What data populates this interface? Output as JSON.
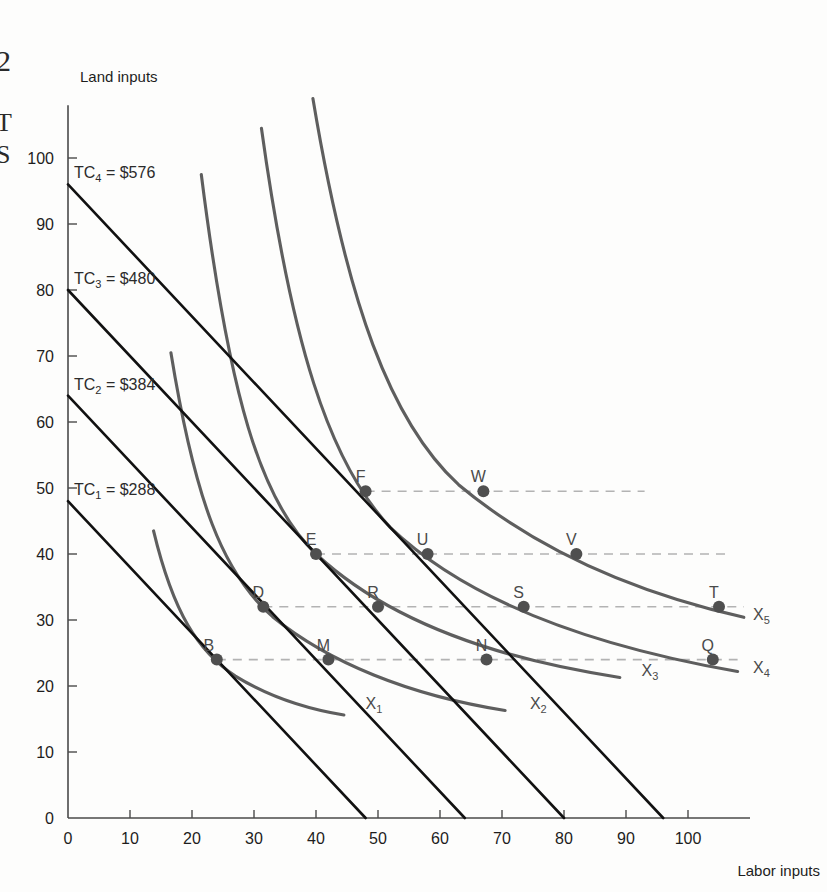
{
  "margin": {
    "figure_number": "2",
    "line2": "T",
    "line3": "S"
  },
  "axes": {
    "y_title": "Land inputs",
    "x_title": "Labor inputs",
    "x_ticks": [
      "0",
      "10",
      "20",
      "30",
      "40",
      "50",
      "60",
      "70",
      "80",
      "90",
      "100"
    ],
    "y_ticks": [
      "0",
      "10",
      "20",
      "30",
      "40",
      "50",
      "60",
      "70",
      "80",
      "90",
      "100"
    ],
    "x_range": [
      0,
      110
    ],
    "y_range": [
      0,
      108
    ]
  },
  "isocosts": [
    {
      "key": "TC1",
      "label": "TC",
      "sub": "1",
      "value": "= $288",
      "y_intercept": 48,
      "x_intercept": 48
    },
    {
      "key": "TC2",
      "label": "TC",
      "sub": "2",
      "value": "= $384",
      "y_intercept": 64,
      "x_intercept": 64
    },
    {
      "key": "TC3",
      "label": "TC",
      "sub": "3",
      "value": "= $480",
      "y_intercept": 80,
      "x_intercept": 80
    },
    {
      "key": "TC4",
      "label": "TC",
      "sub": "4",
      "value": "= $576",
      "y_intercept": 96,
      "x_intercept": 96
    }
  ],
  "isoquants": [
    {
      "key": "X1",
      "label": "X",
      "sub": "1",
      "label_x": 48,
      "label_y": 16.5
    },
    {
      "key": "X2",
      "label": "X",
      "sub": "2",
      "label_x": 74.5,
      "label_y": 16.5
    },
    {
      "key": "X3",
      "label": "X",
      "sub": "3",
      "label_x": 92.5,
      "label_y": 21.5
    },
    {
      "key": "X4",
      "label": "X",
      "sub": "4",
      "label_x": 110.5,
      "label_y": 22.0
    },
    {
      "key": "X5",
      "label": "X",
      "sub": "5",
      "label_x": 110.5,
      "label_y": 30.0
    }
  ],
  "points": [
    {
      "label": "B",
      "x": 24,
      "y": 24,
      "lx": -8,
      "ly": 9
    },
    {
      "label": "M",
      "x": 42,
      "y": 24,
      "lx": -5,
      "ly": 9
    },
    {
      "label": "N",
      "x": 67.5,
      "y": 24,
      "lx": -5,
      "ly": 9
    },
    {
      "label": "Q",
      "x": 104,
      "y": 24,
      "lx": -5,
      "ly": 9
    },
    {
      "label": "D",
      "x": 31.5,
      "y": 32,
      "lx": -5,
      "ly": 9
    },
    {
      "label": "R",
      "x": 50,
      "y": 32,
      "lx": -5,
      "ly": 9
    },
    {
      "label": "S",
      "x": 73.5,
      "y": 32,
      "lx": -5,
      "ly": 9
    },
    {
      "label": "T",
      "x": 105,
      "y": 32,
      "lx": -5,
      "ly": 9
    },
    {
      "label": "E",
      "x": 40,
      "y": 40,
      "lx": -5,
      "ly": 9
    },
    {
      "label": "U",
      "x": 58,
      "y": 40,
      "lx": -5,
      "ly": 9
    },
    {
      "label": "V",
      "x": 82,
      "y": 40,
      "lx": -5,
      "ly": 9
    },
    {
      "label": "F",
      "x": 48,
      "y": 49.5,
      "lx": -5,
      "ly": 9
    },
    {
      "label": "W",
      "x": 67,
      "y": 49.5,
      "lx": -5,
      "ly": 9
    }
  ],
  "guides": [
    {
      "y": 24,
      "x_from": 24,
      "x_to": 108
    },
    {
      "y": 32,
      "x_from": 31.5,
      "x_to": 109
    },
    {
      "y": 40,
      "x_from": 40,
      "x_to": 106
    },
    {
      "y": 49.5,
      "x_from": 48,
      "x_to": 93
    }
  ],
  "colors": {
    "isocost": "#111111",
    "isoquant": "#5e5e5e",
    "guide": "#b3b3b3",
    "marker": "#4f4f4f",
    "axis": "#4a4a4a",
    "background": "#fdfdfc"
  }
}
